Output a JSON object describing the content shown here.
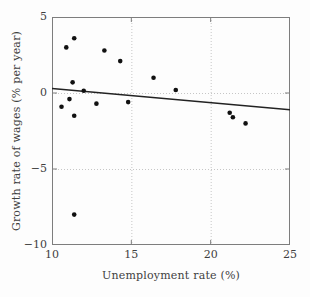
{
  "chart_data": {
    "type": "scatter",
    "title": "",
    "xlabel": "Unemployment rate (%)",
    "ylabel": "Growth rate of wages (% per year)",
    "xlim": [
      10,
      25
    ],
    "ylim": [
      -10,
      5
    ],
    "x_ticks": {
      "values": [
        10,
        15,
        20,
        25
      ],
      "labels": [
        "10",
        "15",
        "20",
        "25"
      ]
    },
    "y_ticks": {
      "values": [
        5,
        0,
        -5,
        -10
      ],
      "labels": [
        "5",
        "0",
        "−5",
        "−10"
      ]
    },
    "x_gridlines": [
      15,
      20
    ],
    "y_gridlines": [
      0,
      -5
    ],
    "grid_style": "dotted",
    "legend": null,
    "points": [
      {
        "x": 10.6,
        "y": -0.9
      },
      {
        "x": 10.9,
        "y": 3.0
      },
      {
        "x": 11.1,
        "y": -0.4
      },
      {
        "x": 11.3,
        "y": 0.7
      },
      {
        "x": 11.4,
        "y": 3.6
      },
      {
        "x": 11.4,
        "y": -1.5
      },
      {
        "x": 11.4,
        "y": -8.0
      },
      {
        "x": 12.0,
        "y": 0.15
      },
      {
        "x": 12.8,
        "y": -0.7
      },
      {
        "x": 13.3,
        "y": 2.8
      },
      {
        "x": 14.3,
        "y": 2.1
      },
      {
        "x": 14.8,
        "y": -0.6
      },
      {
        "x": 16.4,
        "y": 1.0
      },
      {
        "x": 17.8,
        "y": 0.2
      },
      {
        "x": 21.2,
        "y": -1.3
      },
      {
        "x": 21.4,
        "y": -1.6
      },
      {
        "x": 22.2,
        "y": -2.0
      }
    ],
    "trend_line": {
      "x1": 10,
      "y1": 0.3,
      "x2": 25,
      "y2": -1.1
    },
    "colors": {
      "point": "#111111",
      "trend": "#222222",
      "grid": "#c6c6c6",
      "frame": "#7d7d7d",
      "text": "#3f3f3f",
      "background": "#fdfdfd"
    }
  }
}
